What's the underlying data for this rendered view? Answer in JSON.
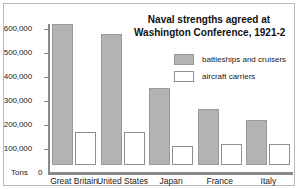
{
  "chart_data": {
    "type": "bar",
    "title": "Naval strengths agreed at Washington Conference, 1921-2",
    "title_lines": [
      "Naval strengths agreed at",
      "Washington Conference, 1921-2"
    ],
    "xlabel": "",
    "ylabel": "Tons",
    "ylim": [
      0,
      600000
    ],
    "grid": false,
    "legend_position": "upper right",
    "ytick_labels": [
      "0",
      "100,000",
      "200,000",
      "300,000",
      "400,000",
      "500,000",
      "600,000"
    ],
    "ytick_values": [
      0,
      100000,
      200000,
      300000,
      400000,
      500000,
      600000
    ],
    "zero_label": "0",
    "categories": [
      "Great Britain",
      "United States",
      "Japan",
      "France",
      "Italy"
    ],
    "series": [
      {
        "name": "battleships and cruisers",
        "color": "#b3b3b3",
        "values": [
          588000,
          545000,
          320000,
          233000,
          187000
        ]
      },
      {
        "name": "aircraft carriers",
        "color": "#ffffff",
        "values": [
          137000,
          137000,
          81000,
          87000,
          87000
        ]
      }
    ]
  },
  "colors": {
    "battleships_swatch": "#b3b3b3",
    "carriers_swatch": "#ffffff",
    "axis": "#8a8a8a",
    "frame": "#b9b9b9",
    "text": "#1a1a1a"
  }
}
